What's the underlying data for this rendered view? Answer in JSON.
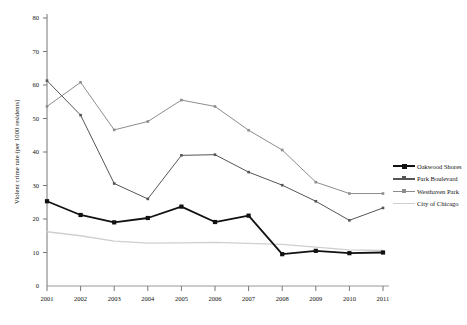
{
  "chart_data": {
    "type": "line",
    "title": "",
    "xlabel": "",
    "ylabel": "Violent crime rate (per 1000 residents)",
    "categories": [
      "2001",
      "2002",
      "2003",
      "2004",
      "2005",
      "2006",
      "2007",
      "2008",
      "2009",
      "2010",
      "2011"
    ],
    "x": [
      2001,
      2002,
      2003,
      2004,
      2005,
      2006,
      2007,
      2008,
      2009,
      2010,
      2011
    ],
    "ylim": [
      0,
      80
    ],
    "yticks": [
      "0",
      "10",
      "20",
      "30",
      "40",
      "50",
      "60",
      "70",
      "80"
    ],
    "grid": false,
    "legend_position": "right",
    "series": [
      {
        "name": "Oakwood Shores",
        "color": "#111111",
        "marker": "square",
        "values": [
          25.3,
          21.2,
          19.0,
          20.3,
          23.7,
          19.1,
          21.0,
          9.5,
          10.5,
          9.8,
          10.0
        ]
      },
      {
        "name": "Park Boulevard",
        "color": "#555555",
        "marker": "square",
        "values": [
          61.3,
          51.0,
          30.6,
          26.0,
          39.0,
          39.2,
          34.0,
          30.1,
          25.3,
          19.6,
          23.3
        ]
      },
      {
        "name": "Westhaven Park",
        "color": "#8d8d8d",
        "marker": "square",
        "values": [
          53.6,
          60.8,
          46.6,
          49.1,
          55.5,
          53.6,
          46.5,
          40.6,
          31.0,
          27.6,
          27.6
        ]
      },
      {
        "name": "City of Chicago",
        "color": "#cfcfcf",
        "marker": "none",
        "values": [
          16.2,
          15.0,
          13.4,
          12.8,
          12.9,
          13.0,
          12.7,
          12.4,
          11.6,
          10.8,
          10.6
        ]
      }
    ]
  },
  "legend": {
    "items": [
      {
        "label": "Oakwood Shores"
      },
      {
        "label": "Park Boulevard"
      },
      {
        "label": "Westhaven Park"
      },
      {
        "label": "City of Chicago"
      }
    ]
  }
}
